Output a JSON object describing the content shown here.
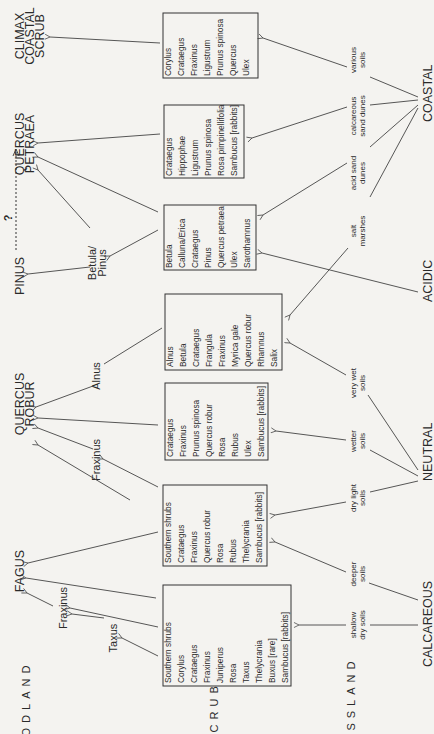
{
  "orientation": "rotated-90-ccw",
  "zones": {
    "woodland": "WOODLAND",
    "scrub": "SCRUB",
    "grassland": "GRASSLAND"
  },
  "sources": {
    "coastal": "COASTAL",
    "acidic": "ACIDIC",
    "neutral": "NEUTRAL",
    "calcareous": "CALCAREOUS"
  },
  "soils": {
    "various": [
      "various",
      "soils"
    ],
    "calc_dunes": [
      "calcareous",
      "sand dunes"
    ],
    "acid_dunes": [
      "acid sand",
      "dunes"
    ],
    "salt": [
      "salt",
      "marshes"
    ],
    "very_wet": [
      "very wet",
      "soils"
    ],
    "wetter": [
      "wetter",
      "soils"
    ],
    "dry_light": [
      "dry light",
      "soils"
    ],
    "deeper": [
      "deeper",
      "soils"
    ],
    "shallow": [
      "shallow",
      "dry soils"
    ]
  },
  "climax": {
    "coastal_scrub": [
      "CLIMAX",
      "COASTAL",
      "SCRUB"
    ],
    "quercus_petraea": [
      "QUERCUS",
      "PETRAEA"
    ],
    "pinus": "PINUS",
    "question": "?",
    "quercus_robur": [
      "QUERCUS",
      "ROBUR"
    ],
    "fagus": "FAGUS"
  },
  "intermediates": {
    "betula_pinus": [
      "Betula/",
      "Pinus"
    ],
    "alnus": "Alnus",
    "fraxinus_robur": "Fraxinus",
    "fraxinus_fagus": "Fraxinus",
    "taxus": "Taxus"
  },
  "boxes": [
    {
      "id": "coastal-various",
      "species": [
        "Corylus",
        "Crataegus",
        "Fraxinus",
        "Ligustrum",
        "Prunus spinosa",
        "Quercus",
        "Ulex"
      ]
    },
    {
      "id": "calcareous-dunes",
      "species": [
        "Crataegus",
        "Hippophae",
        "Ligustrum",
        "Prunus spinosa",
        "Rosa pimpinellifolia",
        "Sambucus [rabbits]"
      ]
    },
    {
      "id": "acidic",
      "species": [
        "Betula",
        "Calluna/Erica",
        "Crataegus",
        "Pinus",
        "Quercus petraea",
        "Ulex",
        "Sarothamnus"
      ]
    },
    {
      "id": "very-wet",
      "species": [
        "Alnus",
        "Betula",
        "Crataegus",
        "Frangula",
        "Fraxinus",
        "Myrica gale",
        "Quercus  robur",
        "Rhamnus",
        "Salix"
      ]
    },
    {
      "id": "wetter",
      "species": [
        "Crataegus",
        "Fraxinus",
        "Prunus spinosa",
        "Quercus robur",
        "Rosa",
        "Rubus",
        "Ulex",
        "Sambucus [rabbits]"
      ]
    },
    {
      "id": "dry-light-deeper",
      "species": [
        "Southern shrubs",
        "Crataegus",
        "Fraxinus",
        "Quercus  robur",
        "Rosa",
        "Rubus",
        "Thelycrania",
        "Sambucus [rabbits]"
      ]
    },
    {
      "id": "shallow-dry",
      "species": [
        "Southern shrubs",
        "Corylus",
        "Crataegus",
        "Fraxinus",
        "Juniperus",
        "Rosa",
        "Taxus",
        "Thelycrania",
        "Buxus [rare]",
        "Sambucus [rabbits]"
      ]
    }
  ]
}
